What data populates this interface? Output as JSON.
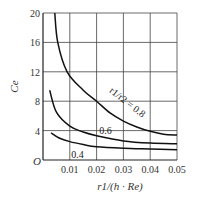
{
  "chart_data": {
    "type": "line",
    "title": "",
    "xlabel": "r1/(h · Re)",
    "ylabel": "Ce",
    "xlim": [
      0,
      0.05
    ],
    "ylim": [
      0,
      20
    ],
    "x_ticks": [
      "0.01",
      "0.02",
      "0.03",
      "0.04",
      "0.05"
    ],
    "y_ticks": [
      "4",
      "8",
      "12",
      "16",
      "20"
    ],
    "origin_label": "O",
    "grid": true,
    "series": [
      {
        "name": "r1/r2 = 0.8",
        "label": "r1/r2 = 0.8",
        "x": [
          0.0044,
          0.0055,
          0.009,
          0.015,
          0.02,
          0.025,
          0.03,
          0.035,
          0.04,
          0.045,
          0.05
        ],
        "y": [
          20,
          16,
          12,
          9.5,
          8.0,
          6.4,
          5.3,
          4.5,
          3.9,
          3.5,
          3.4
        ]
      },
      {
        "name": "0.6",
        "label": "0.6",
        "x": [
          0.0025,
          0.005,
          0.01,
          0.015,
          0.02,
          0.03,
          0.04,
          0.05
        ],
        "y": [
          9.5,
          6.5,
          4.6,
          3.8,
          3.3,
          2.6,
          2.3,
          2.2
        ]
      },
      {
        "name": "0.4",
        "label": "0.4",
        "x": [
          0.003,
          0.006,
          0.01,
          0.015,
          0.02,
          0.03,
          0.04,
          0.05
        ],
        "y": [
          3.7,
          3.0,
          2.5,
          2.1,
          1.8,
          1.6,
          1.5,
          1.4
        ]
      }
    ]
  }
}
